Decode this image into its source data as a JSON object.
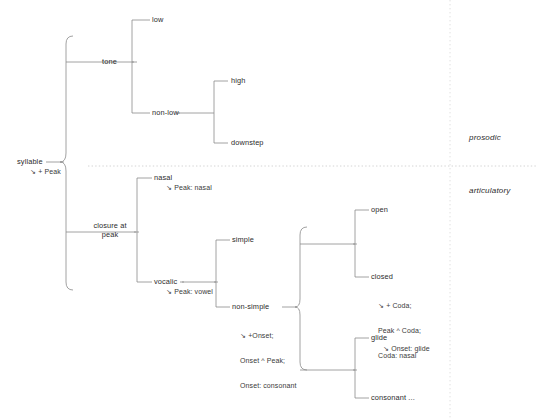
{
  "diagram": {
    "type": "tree",
    "domain": "phonology-syllable-structure",
    "colors": {
      "line": "#8a8a8a",
      "text": "#2b2b2b",
      "divider": "#c9c9c9",
      "background": "#ffffff"
    },
    "regions": [
      {
        "id": "prosodic",
        "label": "prosodic"
      },
      {
        "id": "articulatory",
        "label": "articulatory"
      }
    ],
    "nodes": [
      {
        "id": "syllable",
        "label": "syllable",
        "annotation": "↘ + Peak",
        "annotation_lines": [
          "↘ + Peak"
        ]
      },
      {
        "id": "tone",
        "label": "tone",
        "annotation": "",
        "annotation_lines": []
      },
      {
        "id": "low",
        "label": "low",
        "annotation": "",
        "annotation_lines": []
      },
      {
        "id": "non-low",
        "label": "non-low",
        "annotation": "",
        "annotation_lines": []
      },
      {
        "id": "high",
        "label": "high",
        "annotation": "",
        "annotation_lines": []
      },
      {
        "id": "downstep",
        "label": "downstep",
        "annotation": "",
        "annotation_lines": []
      },
      {
        "id": "closure-at-peak",
        "label": "closure at peak",
        "label_line1": "closure at",
        "label_line2": "peak",
        "annotation": "",
        "annotation_lines": []
      },
      {
        "id": "nasal",
        "label": "nasal",
        "annotation": "↘ Peak: nasal",
        "annotation_lines": [
          "↘ Peak: nasal"
        ]
      },
      {
        "id": "vocalic",
        "label": "vocalic",
        "annotation": "↘ Peak: vowel",
        "annotation_lines": [
          "↘ Peak: vowel"
        ]
      },
      {
        "id": "simple",
        "label": "simple",
        "annotation": "",
        "annotation_lines": []
      },
      {
        "id": "non-simple",
        "label": "non-simple",
        "annotation": "↘ +Onset; Onset ^ Peak; Onset: consonant",
        "annotation_lines": [
          "↘ +Onset;",
          "Onset ^ Peak;",
          "Onset: consonant"
        ]
      },
      {
        "id": "open",
        "label": "open",
        "annotation": "",
        "annotation_lines": []
      },
      {
        "id": "closed",
        "label": "closed",
        "annotation": "↘ + Coda; Peak ^ Coda; Coda: nasal",
        "annotation_lines": [
          "↘ + Coda;",
          "Peak ^ Coda;",
          "Coda: nasal"
        ]
      },
      {
        "id": "glide",
        "label": "glide",
        "annotation": "↘ Onset: glide",
        "annotation_lines": [
          "↘ Onset: glide"
        ]
      },
      {
        "id": "consonant",
        "label": "consonant ...",
        "annotation": "",
        "annotation_lines": []
      }
    ],
    "edges": [
      {
        "from": "syllable",
        "to": "tone"
      },
      {
        "from": "syllable",
        "to": "closure-at-peak"
      },
      {
        "from": "tone",
        "to": "low"
      },
      {
        "from": "tone",
        "to": "non-low"
      },
      {
        "from": "non-low",
        "to": "high"
      },
      {
        "from": "non-low",
        "to": "downstep"
      },
      {
        "from": "closure-at-peak",
        "to": "nasal"
      },
      {
        "from": "closure-at-peak",
        "to": "vocalic"
      },
      {
        "from": "vocalic",
        "to": "simple"
      },
      {
        "from": "vocalic",
        "to": "non-simple"
      },
      {
        "from": "non-simple",
        "to": "open"
      },
      {
        "from": "non-simple",
        "to": "closed"
      },
      {
        "from": "non-simple",
        "to": "glide"
      },
      {
        "from": "non-simple",
        "to": "consonant"
      }
    ]
  }
}
